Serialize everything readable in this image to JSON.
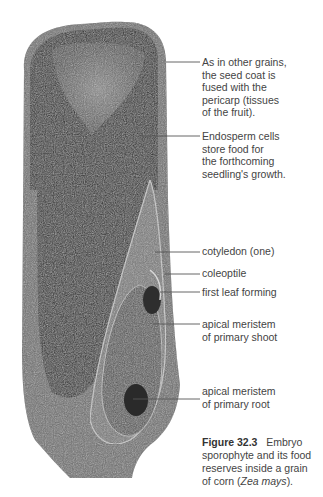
{
  "figure": {
    "labels": [
      {
        "lines": [
          "As in other grains,",
          "the seed coat is",
          "fused with the",
          "pericarp (tissues",
          "of the fruit)."
        ]
      },
      {
        "lines": [
          "Endosperm cells",
          "store food for",
          "the forthcoming",
          "seedling's growth."
        ]
      },
      {
        "lines": [
          "cotyledon (one)"
        ]
      },
      {
        "lines": [
          "coleoptile"
        ]
      },
      {
        "lines": [
          "first leaf forming"
        ]
      },
      {
        "lines": [
          "apical meristem",
          "of primary shoot"
        ]
      },
      {
        "lines": [
          "apical meristem",
          "of primary root"
        ]
      }
    ],
    "caption": {
      "number": "Figure 32.3",
      "text_line1": "Embryo",
      "text_line2": "sporophyte and its food",
      "text_line3": "reserves inside a grain",
      "text_line4_pre": "of corn (",
      "text_line4_italic": "Zea mays",
      "text_line4_post": ")."
    }
  }
}
